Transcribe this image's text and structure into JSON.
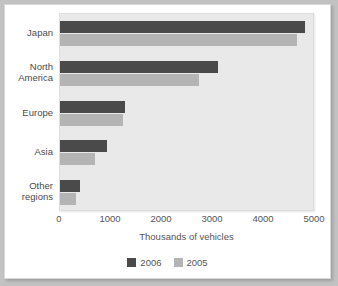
{
  "chart_data": {
    "type": "bar",
    "orientation": "horizontal",
    "title": "",
    "xlabel": "Thousands of vehicles",
    "ylabel": "",
    "xlim": [
      0,
      5000
    ],
    "xticks": [
      0,
      1000,
      2000,
      3000,
      4000,
      5000
    ],
    "xtick_labels": [
      "0",
      "1000",
      "2000",
      "3000",
      "4000",
      "5000"
    ],
    "grid": false,
    "legend_position": "bottom",
    "categories": [
      "Japan",
      "North America",
      "Europe",
      "Asia",
      "Other regions"
    ],
    "category_label_lines": [
      [
        "Japan"
      ],
      [
        "North",
        "America"
      ],
      [
        "Europe"
      ],
      [
        "Asia"
      ],
      [
        "Other",
        "regions"
      ]
    ],
    "series": [
      {
        "name": "2006",
        "color": "#4a4a4a",
        "values": [
          4800,
          3100,
          1270,
          930,
          390
        ]
      },
      {
        "name": "2005",
        "color": "#b4b4b4",
        "values": [
          4650,
          2720,
          1230,
          690,
          310
        ]
      }
    ]
  },
  "legend": {
    "items": [
      {
        "label": "2006",
        "color": "#4a4a4a"
      },
      {
        "label": "2005",
        "color": "#b4b4b4"
      }
    ]
  },
  "colors": {
    "series_2006": "#4a4a4a",
    "series_2005": "#b4b4b4",
    "plot_background": "#e9e9e9",
    "card_background": "#ffffff",
    "outer_background": "#c2c2c2",
    "text": "#555555"
  }
}
